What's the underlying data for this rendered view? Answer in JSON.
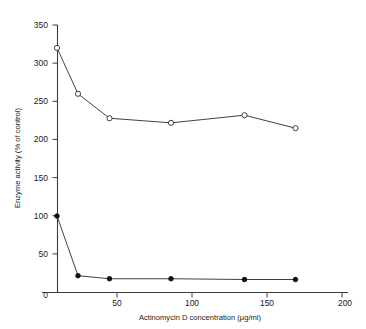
{
  "chart_data": {
    "type": "line",
    "title": "",
    "xlabel": "Actinomycin D concentration  (µg/ml)",
    "ylabel": "Enzyme activity  (% of control)",
    "xlim": [
      0,
      200
    ],
    "ylim": [
      0,
      350
    ],
    "xticks": [
      0,
      50,
      100,
      150,
      200
    ],
    "xtick_labels": [
      "0",
      "50",
      "100",
      "150",
      "200"
    ],
    "yticks": [
      0,
      50,
      100,
      150,
      200,
      250,
      300,
      350
    ],
    "ytick_labels": [
      "0",
      "50",
      "100",
      "150",
      "200",
      "250",
      "300",
      "350"
    ],
    "grid": false,
    "legend": "none",
    "series": [
      {
        "name": "open-circle-series",
        "marker": "open-circle",
        "x": [
          10,
          24,
          45,
          86,
          135,
          169
        ],
        "y": [
          320,
          260,
          228,
          222,
          232,
          215
        ]
      },
      {
        "name": "filled-circle-series",
        "marker": "filled-circle",
        "x": [
          10,
          24,
          45,
          86,
          135,
          169
        ],
        "y": [
          100,
          22,
          18,
          18,
          17,
          17
        ]
      }
    ]
  },
  "axes": {
    "y_axis_title": "Enzyme activity  (% of control)",
    "x_axis_title": "Actinomycin D concentration  (µg/ml)"
  }
}
